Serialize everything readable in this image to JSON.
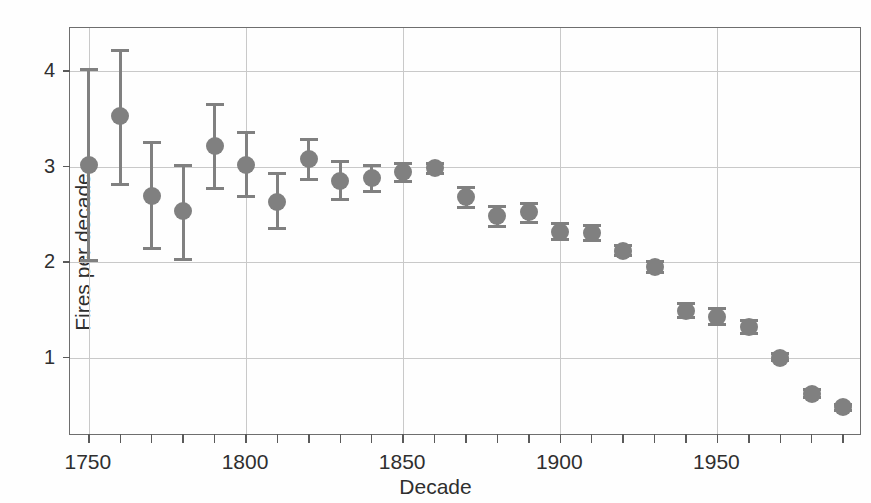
{
  "chart_data": {
    "type": "scatter",
    "title": "",
    "xlabel": "Decade",
    "ylabel": "Fires per decade",
    "xlim": [
      1744,
      1996
    ],
    "ylim": [
      0.18,
      4.45
    ],
    "grid": true,
    "legend": null,
    "marker_color": "#808080",
    "errorbar_color": "#808080",
    "axis_color": "#6e6e6e",
    "grid_color": "#c9c9c9",
    "ytick_values": [
      1,
      2,
      3,
      4
    ],
    "ytick_labels": [
      "1",
      "2",
      "3",
      "4"
    ],
    "xtick_major_values": [
      1750,
      1800,
      1850,
      1900,
      1950
    ],
    "xtick_major_labels": [
      "1750",
      "1800",
      "1850",
      "1900",
      "1950"
    ],
    "xtick_minor_values": [
      1760,
      1770,
      1780,
      1790,
      1810,
      1820,
      1830,
      1840,
      1860,
      1870,
      1880,
      1890,
      1910,
      1920,
      1930,
      1940,
      1960,
      1970,
      1980,
      1990
    ],
    "x": [
      1750,
      1760,
      1770,
      1780,
      1790,
      1800,
      1810,
      1820,
      1830,
      1840,
      1850,
      1860,
      1870,
      1880,
      1890,
      1900,
      1910,
      1920,
      1930,
      1940,
      1950,
      1960,
      1970,
      1980,
      1990
    ],
    "values": [
      3.02,
      3.53,
      2.69,
      2.53,
      3.21,
      3.02,
      2.63,
      3.08,
      2.85,
      2.88,
      2.94,
      2.98,
      2.68,
      2.48,
      2.52,
      2.32,
      2.3,
      2.12,
      1.95,
      1.49,
      1.43,
      1.32,
      1.0,
      0.62,
      0.48
    ],
    "err_low": [
      2.0,
      2.8,
      2.13,
      2.01,
      2.75,
      2.67,
      2.34,
      2.85,
      2.64,
      2.72,
      2.83,
      2.91,
      2.56,
      2.36,
      2.4,
      2.22,
      2.21,
      2.05,
      1.88,
      1.4,
      1.33,
      1.24,
      0.95,
      0.57,
      0.43
    ],
    "err_high": [
      4.03,
      4.23,
      3.27,
      3.03,
      3.67,
      3.37,
      2.94,
      3.3,
      3.07,
      3.03,
      3.05,
      3.05,
      2.8,
      2.6,
      2.63,
      2.42,
      2.4,
      2.19,
      2.02,
      1.58,
      1.53,
      1.4,
      1.06,
      0.68,
      0.53
    ]
  },
  "axes": {
    "y_title": "Fires per decade",
    "x_title": "Decade"
  }
}
